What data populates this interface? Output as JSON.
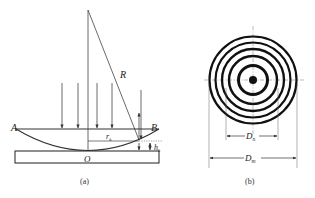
{
  "figure_a": {
    "caption": "(a)",
    "labels": {
      "A": "A",
      "B": "B",
      "R": "R",
      "r_k": "r",
      "r_k_sub": "k",
      "O": "O",
      "h_k": "h",
      "h_k_sub": "k"
    },
    "incident_arrows": 4
  },
  "figure_b": {
    "caption": "(b)",
    "labels": {
      "D_n": "D",
      "D_n_sub": "n",
      "D_m": "D",
      "D_m_sub": "m"
    },
    "ring_count": 6
  },
  "colors": {
    "line": "#333333",
    "ring": "#111111",
    "background": "#ffffff"
  }
}
